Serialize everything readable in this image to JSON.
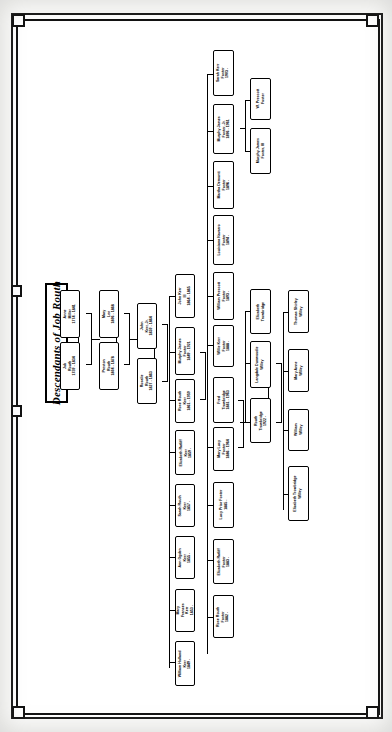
{
  "document": {
    "title": "Descendants of Job Routh",
    "type": "genealogy-chart",
    "orientation": "landscape-rotated-90"
  },
  "colors": {
    "ink": "#000000",
    "page": "#ffffff",
    "scan_background": "#f2f1ef"
  },
  "generations": [
    {
      "index": 1,
      "label": "Generation 1"
    },
    {
      "index": 2,
      "label": "Generation 2"
    },
    {
      "index": 3,
      "label": "Generation 3"
    },
    {
      "index": 4,
      "label": "Generation 4"
    },
    {
      "index": 5,
      "label": "Generation 5"
    },
    {
      "index": 6,
      "label": "Generation 6"
    },
    {
      "index": 7,
      "label": "Generation 7"
    }
  ],
  "people": [
    {
      "id": "p01",
      "name": "Anne",
      "surname": "Miller",
      "dates": "1774 - 1841",
      "lines": [
        "Anne",
        "Miller",
        "1774 - 1841"
      ]
    },
    {
      "id": "p02",
      "name": "Job",
      "surname": "Routh",
      "dates": "1759 - 1834",
      "lines": [
        "Job",
        "Routh",
        "1759 - 1834"
      ]
    },
    {
      "id": "p03",
      "name": "Mary",
      "surname": "Lee",
      "dates": "1806 - 1868",
      "lines": [
        "Mary",
        "Lee",
        "1806 - 1868"
      ]
    },
    {
      "id": "p04",
      "name": "Preston",
      "surname": "Routh",
      "dates": "1804 - 1878",
      "lines": [
        "Preston",
        "Routh",
        "1804 - 1878"
      ]
    },
    {
      "id": "p05",
      "name": "John",
      "surname": "Kerr, Jr.",
      "dates": "1830 - 1864",
      "lines": [
        "John",
        "Kerr, Jr.",
        "1830 - 1864"
      ]
    },
    {
      "id": "p06",
      "name": "Rosalie",
      "surname": "Routh",
      "dates": "1827 - 1863",
      "lines": [
        "Rosalie",
        "Routh",
        "1827 - 1863"
      ]
    },
    {
      "id": "p07",
      "name": "John Kerr",
      "surname": "III",
      "dates": "1864 - 1865",
      "lines": [
        "John Kerr",
        "III",
        "1864 - 1865"
      ]
    },
    {
      "id": "p08",
      "name": "Murphy James",
      "surname": "Foster",
      "dates": "1849 - 1921",
      "lines": [
        "Murphy James",
        "Foster",
        "1849 - 1921"
      ]
    },
    {
      "id": "p09",
      "name": "Rose Routh",
      "surname": "Kerr",
      "dates": "1861 - 1959",
      "lines": [
        "Rose Routh",
        "Kerr",
        "1861 - 1959"
      ]
    },
    {
      "id": "p10",
      "name": "Elizabeth Ratliff",
      "surname": "Kerr",
      "dates": "1859 -",
      "lines": [
        "Elizabeth Ratliff",
        "Kerr",
        "1859 -"
      ]
    },
    {
      "id": "p11",
      "name": "Sarah Routh",
      "surname": "Kerr",
      "dates": "1857 -",
      "lines": [
        "Sarah Routh",
        "Kerr",
        "1857 -"
      ]
    },
    {
      "id": "p12",
      "name": "Ann Ogden",
      "surname": "Kerr",
      "dates": "1855 -",
      "lines": [
        "Ann Ogden",
        "Kerr",
        "1855 -"
      ]
    },
    {
      "id": "p13",
      "name": "Mary Frances",
      "surname": "Kerr",
      "dates": "1853 -",
      "lines": [
        "Mary",
        "Frances",
        "Kerr",
        "1853 -"
      ]
    },
    {
      "id": "p14",
      "name": "William Holland",
      "surname": "Kerr",
      "dates": "1849 -",
      "lines": [
        "William Holland",
        "Kerr",
        "1849 -"
      ]
    },
    {
      "id": "p15",
      "name": "Sarah Kerr",
      "surname": "Foster",
      "dates": "1903 -",
      "lines": [
        "Sarah Kerr",
        "Foster",
        "1903 -"
      ]
    },
    {
      "id": "p16",
      "name": "Murphy James",
      "surname": "Foster, Jr.",
      "dates": "1896 - 1961",
      "lines": [
        "Murphy James",
        "Foster, Jr.",
        "1896 - 1961"
      ]
    },
    {
      "id": "p17",
      "name": "Martha Demontt",
      "surname": "Foster",
      "dates": "1896 -",
      "lines": [
        "Martha Demontt",
        "Foster",
        "1896 -"
      ]
    },
    {
      "id": "p18",
      "name": "Louisiana Navarro",
      "surname": "Foster",
      "dates": "1894 -",
      "lines": [
        "Louisiana Navarro",
        "Foster",
        "1894 -"
      ]
    },
    {
      "id": "p19",
      "name": "William Prescott",
      "surname": "Foster",
      "dates": "1893 -",
      "lines": [
        "William Prescott",
        "Foster",
        "1893 -"
      ]
    },
    {
      "id": "p20",
      "name": "Willie Kerr",
      "surname": "Foster",
      "dates": "1888 -",
      "lines": [
        "Willie Kerr",
        "Foster",
        "1888 -"
      ]
    },
    {
      "id": "p21",
      "name": "Fred",
      "surname": "Trowbridge",
      "dates": "1881 - 1963",
      "lines": [
        "Fred",
        "Trowbridge",
        "1881 - 1963"
      ]
    },
    {
      "id": "p22",
      "name": "Mary Lucy",
      "surname": "Foster",
      "dates": "1886 - 1964",
      "lines": [
        "Mary Lucy",
        "Foster",
        "1886 - 1964"
      ]
    },
    {
      "id": "p23",
      "name": "Lucy Prior Foster",
      "surname": "Foster",
      "dates": "1885 -",
      "lines": [
        "Lucy Prior Foster",
        "1885 -"
      ]
    },
    {
      "id": "p24",
      "name": "Elizabeth Ratliff",
      "surname": "Foster",
      "dates": "1883 -",
      "lines": [
        "Elizabeth Ratliff",
        "Foster",
        "1883 -"
      ]
    },
    {
      "id": "p25",
      "name": "Rose Routh",
      "surname": "Foster",
      "dates": "1882 -",
      "lines": [
        "Rose Routh",
        "Foster",
        "1882 -"
      ]
    },
    {
      "id": "p26",
      "name": "W. Prescott",
      "surname": "Foster",
      "dates": "",
      "lines": [
        "W. Prescott",
        "Foster"
      ]
    },
    {
      "id": "p27",
      "name": "Murphy James",
      "surname": "Foster, III",
      "dates": "",
      "lines": [
        "Murphy James",
        "Foster, III"
      ]
    },
    {
      "id": "p28",
      "name": "Elizabeth",
      "surname": "Trowbridge",
      "dates": "",
      "lines": [
        "Elizabeth",
        "Trowbridge"
      ]
    },
    {
      "id": "p29",
      "name": "Langdale Dunwoodie",
      "surname": "Willey",
      "dates": "",
      "lines": [
        "Langdale Dunwoodie",
        "Willey"
      ]
    },
    {
      "id": "p30",
      "name": "Routh",
      "surname": "Trowbridge",
      "dates": "1922 -",
      "lines": [
        "Routh",
        "Trowbridge",
        "1922 -"
      ]
    },
    {
      "id": "p31",
      "name": "Thomas Shirley",
      "surname": "Willey",
      "dates": "",
      "lines": [
        "Thomas Shirley",
        "Willey"
      ]
    },
    {
      "id": "p32",
      "name": "Mary Anne",
      "surname": "Willey",
      "dates": "",
      "lines": [
        "Mary Anne",
        "Willey"
      ]
    },
    {
      "id": "p33",
      "name": "William",
      "surname": "Willey",
      "dates": "",
      "lines": [
        "William",
        "Willey"
      ]
    },
    {
      "id": "p34",
      "name": "Elizabeth Trowbridge",
      "surname": "Willey",
      "dates": "",
      "lines": [
        "Elizabeth Trowbridge",
        "Willey"
      ]
    }
  ]
}
